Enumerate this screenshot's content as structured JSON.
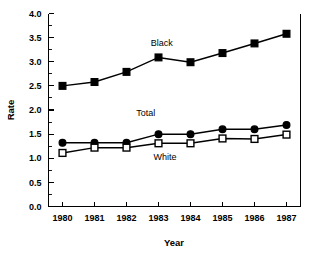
{
  "chart_data": {
    "type": "line",
    "title": "",
    "subtitle": "",
    "xlabel": "Year",
    "ylabel": "Rate",
    "categories": [
      1980,
      1981,
      1982,
      1983,
      1984,
      1985,
      1986,
      1987
    ],
    "xtick_labels": [
      "1980",
      "1981",
      "1982",
      "1983",
      "1984",
      "1985",
      "1986",
      "1987"
    ],
    "ytick_labels": [
      "0.0",
      "0.5",
      "1.0",
      "1.5",
      "2.0",
      "2.5",
      "3.0",
      "3.5",
      "4.0"
    ],
    "ytick_values": [
      0.0,
      0.5,
      1.0,
      1.5,
      2.0,
      2.5,
      3.0,
      3.5,
      4.0
    ],
    "ylim": [
      0.0,
      4.0
    ],
    "xlim": [
      1980,
      1987
    ],
    "grid": false,
    "legend_position": "inline-annotations",
    "series": [
      {
        "name": "Black",
        "marker": "filled-square",
        "label_x": 1983.1,
        "label_y": 3.33,
        "values": [
          2.5,
          2.58,
          2.79,
          3.09,
          2.99,
          3.18,
          3.38,
          3.58
        ]
      },
      {
        "name": "Total",
        "marker": "filled-circle",
        "label_x": 1982.6,
        "label_y": 1.88,
        "values": [
          1.32,
          1.32,
          1.32,
          1.5,
          1.5,
          1.6,
          1.6,
          1.69
        ]
      },
      {
        "name": "White",
        "marker": "open-square",
        "label_x": 1983.2,
        "label_y": 0.97,
        "values": [
          1.11,
          1.22,
          1.22,
          1.31,
          1.31,
          1.41,
          1.4,
          1.49
        ]
      }
    ]
  },
  "colors": {
    "axis": "#000000",
    "series_black": "#000000",
    "series_total": "#000000",
    "series_white_fill": "#ffffff",
    "background": "#ffffff"
  }
}
